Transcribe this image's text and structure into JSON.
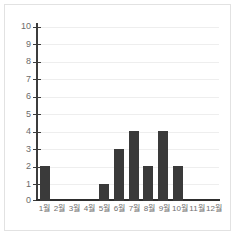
{
  "chart_data": {
    "type": "bar",
    "title": "",
    "subtitle": "",
    "xlabel": "",
    "ylabel": "",
    "categories": [
      "1월",
      "2월",
      "3월",
      "4월",
      "5월",
      "6월",
      "7월",
      "8월",
      "9월",
      "10월",
      "11월",
      "12월"
    ],
    "values": [
      2,
      0,
      0,
      0,
      1,
      3,
      4,
      2,
      4,
      2,
      0,
      0
    ],
    "ylim": [
      0,
      10
    ],
    "ytick_labels": [
      "10",
      "9",
      "8",
      "7",
      "6",
      "5",
      "4",
      "3",
      "2",
      "1",
      "0"
    ],
    "ytick_values": [
      10,
      9,
      8,
      7,
      6,
      5,
      4,
      3,
      2,
      1,
      0
    ],
    "grid": true,
    "legend": false,
    "bar_color": "#3a3a3a",
    "grid_color": "#eeeeee",
    "axis_color": "#3c3c3c",
    "tick_label_color": "#6b6b6b",
    "background_color": "#ffffff",
    "border_color": "#e2e2e2"
  }
}
